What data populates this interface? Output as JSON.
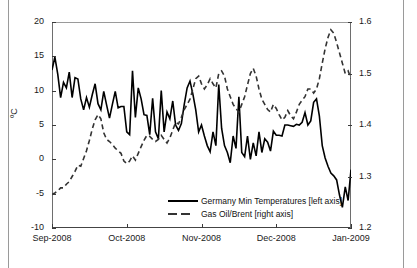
{
  "chart_data": {
    "type": "line",
    "title": "",
    "xlabel": "",
    "ylabel": "ºC",
    "y2label": "",
    "grid": false,
    "legend_position": "inside-bottom-center",
    "xtick_labels": [
      "Sep-2008",
      "Oct-2008",
      "Nov-2008",
      "Dec-2008",
      "Jan-2009"
    ],
    "ylim": [
      -10,
      20
    ],
    "ytick_labels": [
      "-10",
      "-5",
      "0",
      "5",
      "10",
      "15",
      "20"
    ],
    "y2lim": [
      1.2,
      1.6
    ],
    "y2tick_labels": [
      "1.2",
      "1.3",
      "1.4",
      "1.5",
      "1.6"
    ],
    "series": [
      {
        "name": "Germany Min Temperatures [left axis]",
        "axis": "left",
        "style": "solid",
        "color": "#000000",
        "values": [
          13.0,
          14.9,
          12.4,
          9.0,
          11.2,
          10.4,
          12.7,
          9.0,
          11.9,
          11.7,
          8.8,
          7.2,
          9.0,
          7.6,
          9.4,
          11.0,
          8.1,
          7.2,
          9.9,
          7.9,
          6.0,
          8.0,
          9.9,
          7.5,
          7.7,
          7.7,
          4.0,
          3.6,
          12.9,
          6.1,
          10.4,
          8.8,
          6.5,
          6.4,
          3.6,
          8.9,
          4.0,
          3.0,
          10.0,
          4.0,
          6.9,
          5.9,
          8.5,
          5.0,
          4.2,
          5.2,
          8.0,
          10.4,
          11.4,
          9.5,
          7.2,
          4.0,
          5.0,
          3.4,
          2.0,
          1.1,
          4.0,
          2.0,
          10.9,
          4.5,
          2.0,
          1.0,
          -0.5,
          3.4,
          1.6,
          9.1,
          1.0,
          0.4,
          3.4,
          0.0,
          2.4,
          0.5,
          4.0,
          1.0,
          3.0,
          2.5,
          1.2,
          4.1,
          3.5,
          3.5,
          3.4,
          5.0,
          5.0,
          4.9,
          4.8,
          5.1,
          5.0,
          5.4,
          6.8,
          5.0,
          5.6,
          8.3,
          8.8,
          6.3,
          2.0,
          0.2,
          -1.0,
          -2.0,
          -2.4,
          -3.0,
          -5.2,
          -7.0,
          -4.0,
          -6.0,
          -1.5
        ]
      },
      {
        "name": "Gas Oil/Brent [right axis]",
        "axis": "right",
        "style": "dashed",
        "color": "#333333",
        "values": [
          1.265,
          1.268,
          1.272,
          1.278,
          1.278,
          1.285,
          1.29,
          1.3,
          1.31,
          1.322,
          1.32,
          1.335,
          1.35,
          1.37,
          1.392,
          1.41,
          1.42,
          1.412,
          1.385,
          1.372,
          1.368,
          1.362,
          1.355,
          1.35,
          1.345,
          1.33,
          1.325,
          1.33,
          1.34,
          1.332,
          1.345,
          1.358,
          1.37,
          1.38,
          1.378,
          1.372,
          1.368,
          1.372,
          1.38,
          1.372,
          1.365,
          1.375,
          1.39,
          1.405,
          1.402,
          1.415,
          1.43,
          1.44,
          1.45,
          1.47,
          1.49,
          1.495,
          1.48,
          1.47,
          1.478,
          1.49,
          1.48,
          1.472,
          1.5,
          1.505,
          1.495,
          1.47,
          1.455,
          1.44,
          1.432,
          1.425,
          1.44,
          1.455,
          1.478,
          1.5,
          1.51,
          1.495,
          1.47,
          1.45,
          1.44,
          1.43,
          1.425,
          1.44,
          1.432,
          1.42,
          1.41,
          1.415,
          1.428,
          1.418,
          1.412,
          1.425,
          1.44,
          1.448,
          1.455,
          1.47,
          1.47,
          1.462,
          1.47,
          1.49,
          1.52,
          1.548,
          1.57,
          1.585,
          1.578,
          1.56,
          1.54,
          1.52,
          1.5,
          1.505,
          1.49
        ]
      }
    ]
  },
  "legend": {
    "items": [
      {
        "label": "Germany Min Temperatures [left axis]"
      },
      {
        "label": "Gas Oil/Brent [right axis]"
      }
    ]
  }
}
